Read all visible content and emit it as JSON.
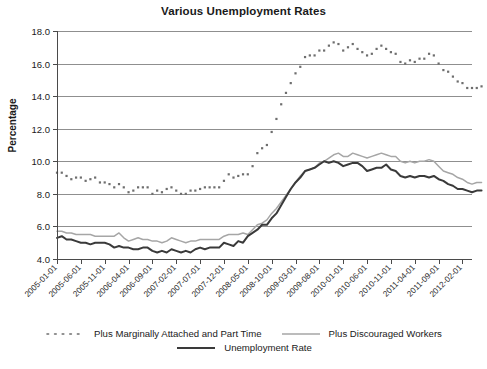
{
  "chart_data": {
    "type": "line",
    "title": "Various Unemployment Rates",
    "xlabel": "",
    "ylabel": "Percentage",
    "ylim": [
      4.0,
      18.0
    ],
    "ytick_labels": [
      "18.0",
      "16.0",
      "14.0",
      "12.0",
      "10.0",
      "8.0",
      "6.0",
      "4.0"
    ],
    "ytick_values": [
      18.0,
      16.0,
      14.0,
      12.0,
      10.0,
      8.0,
      6.0,
      4.0
    ],
    "grid": true,
    "legend_position": "bottom",
    "x_tick_labels": [
      "2005-01-01",
      "2005-06-01",
      "2005-11-01",
      "2006-04-01",
      "2006-09-01",
      "2007-02-01",
      "2007-07-01",
      "2007-12-01",
      "2008-05-01",
      "2008-10-01",
      "2009-03-01",
      "2009-08-01",
      "2010-01-01",
      "2010-06-01",
      "2010-11-01",
      "2011-04-01",
      "2011-09-01",
      "2012-02-01"
    ],
    "x_tick_indices": [
      0,
      5,
      10,
      15,
      20,
      25,
      30,
      35,
      40,
      45,
      50,
      55,
      60,
      65,
      70,
      75,
      80,
      85
    ],
    "x_start": "2005-01-01",
    "x_end": "2012-04-01",
    "n_points": 88,
    "series": [
      {
        "name": "Plus Marginally Attached and Part Time",
        "style": "dotted",
        "color": "#6e6e6e",
        "values": [
          9.3,
          9.3,
          9.1,
          8.9,
          9.0,
          9.0,
          8.8,
          8.9,
          9.0,
          8.7,
          8.7,
          8.6,
          8.4,
          8.6,
          8.4,
          8.1,
          8.2,
          8.4,
          8.4,
          8.4,
          8.0,
          8.2,
          8.1,
          8.3,
          8.4,
          8.2,
          8.0,
          8.0,
          8.2,
          8.2,
          8.3,
          8.4,
          8.4,
          8.4,
          8.4,
          8.8,
          9.2,
          9.0,
          9.1,
          9.2,
          9.2,
          9.7,
          10.5,
          10.8,
          11.0,
          11.8,
          12.6,
          13.5,
          14.2,
          14.8,
          15.4,
          15.8,
          16.4,
          16.5,
          16.5,
          16.8,
          16.8,
          17.1,
          17.3,
          17.2,
          16.8,
          17.0,
          17.2,
          16.9,
          16.7,
          16.5,
          16.6,
          16.9,
          17.1,
          16.9,
          16.7,
          16.6,
          16.1,
          16.0,
          16.2,
          16.1,
          16.3,
          16.3,
          16.6,
          16.5,
          16.0,
          15.6,
          15.5,
          15.2,
          14.9,
          14.8,
          14.5,
          14.5,
          14.5,
          14.6
        ]
      },
      {
        "name": "Plus Discouraged Workers",
        "style": "solid",
        "color": "#a6a6a6",
        "values": [
          5.7,
          5.7,
          5.6,
          5.6,
          5.5,
          5.5,
          5.5,
          5.5,
          5.4,
          5.4,
          5.4,
          5.4,
          5.4,
          5.6,
          5.3,
          5.1,
          5.2,
          5.3,
          5.2,
          5.2,
          5.1,
          5.1,
          5.0,
          5.1,
          5.3,
          5.2,
          5.1,
          5.0,
          5.1,
          5.1,
          5.2,
          5.2,
          5.2,
          5.2,
          5.2,
          5.4,
          5.5,
          5.5,
          5.5,
          5.6,
          5.5,
          5.8,
          6.1,
          6.2,
          6.4,
          6.8,
          7.1,
          7.5,
          7.9,
          8.3,
          8.7,
          9.1,
          9.4,
          9.5,
          9.6,
          9.9,
          10.0,
          10.2,
          10.4,
          10.5,
          10.3,
          10.3,
          10.5,
          10.4,
          10.3,
          10.2,
          10.3,
          10.4,
          10.5,
          10.4,
          10.3,
          10.3,
          10.0,
          9.9,
          10.0,
          9.9,
          10.0,
          10.0,
          10.1,
          10.0,
          9.7,
          9.4,
          9.3,
          9.2,
          9.0,
          8.9,
          8.7,
          8.6,
          8.7,
          8.7
        ]
      },
      {
        "name": "Unemployment Rate",
        "style": "solid",
        "color": "#3a3a3a",
        "values": [
          5.3,
          5.4,
          5.2,
          5.2,
          5.1,
          5.0,
          5.0,
          4.9,
          5.0,
          5.0,
          5.0,
          4.9,
          4.7,
          4.8,
          4.7,
          4.7,
          4.6,
          4.6,
          4.7,
          4.7,
          4.5,
          4.4,
          4.5,
          4.4,
          4.6,
          4.5,
          4.4,
          4.5,
          4.4,
          4.6,
          4.7,
          4.6,
          4.7,
          4.7,
          4.7,
          5.0,
          4.9,
          4.8,
          5.1,
          5.0,
          5.4,
          5.6,
          5.8,
          6.1,
          6.1,
          6.5,
          6.8,
          7.3,
          7.8,
          8.3,
          8.7,
          9.0,
          9.4,
          9.5,
          9.6,
          9.8,
          10.0,
          9.9,
          10.0,
          9.9,
          9.7,
          9.8,
          9.9,
          9.9,
          9.7,
          9.4,
          9.5,
          9.6,
          9.6,
          9.8,
          9.5,
          9.4,
          9.1,
          9.0,
          9.1,
          9.0,
          9.1,
          9.1,
          9.0,
          9.1,
          8.9,
          8.8,
          8.6,
          8.5,
          8.3,
          8.3,
          8.2,
          8.1,
          8.2,
          8.2
        ]
      }
    ]
  },
  "legend": {
    "row1": [
      {
        "label": "Plus Marginally Attached and Part Time",
        "style": "dotted",
        "color": "#6e6e6e"
      },
      {
        "label": "Plus Discouraged Workers",
        "style": "solid",
        "color": "#a6a6a6"
      }
    ],
    "row2": [
      {
        "label": "Unemployment Rate",
        "style": "solid",
        "color": "#3a3a3a"
      }
    ]
  },
  "colors": {
    "marginally_attached": "#6e6e6e",
    "discouraged": "#a6a6a6",
    "unemployment": "#3a3a3a",
    "grid": "#8f8f8f",
    "axis": "#4a4a4a",
    "text": "#1a1a1a",
    "background": "#ffffff"
  }
}
